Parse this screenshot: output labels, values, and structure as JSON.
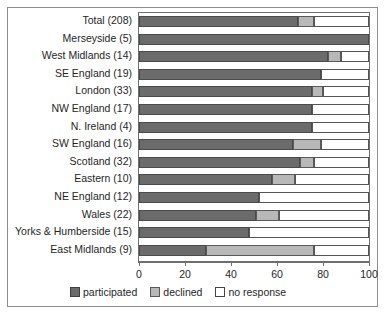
{
  "chart_data": {
    "type": "bar",
    "orientation": "horizontal",
    "stacked": true,
    "stack_mode": "percent",
    "title": "",
    "xlabel": "",
    "ylabel": "",
    "xlim": [
      0,
      100
    ],
    "xticks": [
      0,
      20,
      40,
      60,
      80,
      100
    ],
    "xticklabels": [
      "0",
      "20",
      "40",
      "60",
      "80",
      "100"
    ],
    "grid": false,
    "legend_position": "bottom",
    "categories": [
      "Total (208)",
      "Merseyside (5)",
      "West Midlands (14)",
      "SE England (19)",
      "London (33)",
      "NW England (17)",
      "N. Ireland (4)",
      "SW England (16)",
      "Scotland (32)",
      "Eastern (10)",
      "NE England (12)",
      "Wales (22)",
      "Yorks & Humberside (15)",
      "East Midlands (9)"
    ],
    "series": [
      {
        "name": "participated",
        "color": "#6b6b6b",
        "values": [
          69,
          100,
          82,
          79,
          75,
          75,
          75,
          67,
          70,
          58,
          52,
          51,
          48,
          29
        ]
      },
      {
        "name": "declined",
        "color": "#b8b8b8",
        "values": [
          7,
          0,
          6,
          0,
          5,
          0,
          0,
          12,
          6,
          10,
          0,
          10,
          0,
          47
        ]
      },
      {
        "name": "no response",
        "color": "#ffffff",
        "values": [
          24,
          0,
          12,
          21,
          20,
          25,
          25,
          21,
          24,
          32,
          48,
          39,
          52,
          24
        ]
      }
    ]
  },
  "legend": {
    "entries": [
      {
        "label": "participated",
        "swatch": "participated"
      },
      {
        "label": "declined",
        "swatch": "declined"
      },
      {
        "label": "no response",
        "swatch": "noresponse"
      }
    ]
  }
}
